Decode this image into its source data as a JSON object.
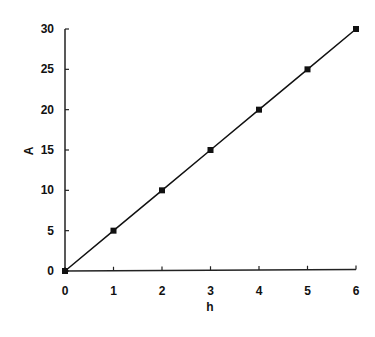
{
  "chart_data": {
    "type": "line",
    "title": "",
    "xlabel": "h",
    "ylabel": "A",
    "x": [
      0,
      1,
      2,
      3,
      4,
      5,
      6
    ],
    "series": [
      {
        "name": "A",
        "values": [
          0,
          5,
          10,
          15,
          20,
          25,
          30
        ],
        "marker": "square",
        "color": "#111111"
      }
    ],
    "xlim": [
      0,
      6
    ],
    "ylim": [
      0,
      30
    ],
    "xticks": [
      0,
      1,
      2,
      3,
      4,
      5,
      6
    ],
    "yticks": [
      0,
      5,
      10,
      15,
      20,
      25,
      30
    ],
    "grid": false,
    "legend": "none"
  }
}
